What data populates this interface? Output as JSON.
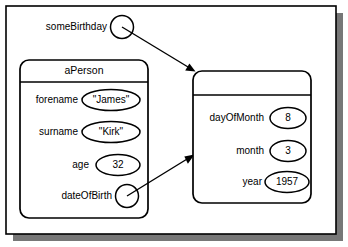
{
  "diagram": {
    "kind": "uml-object-diagram",
    "background_color": "#ffffff",
    "line_color": "#000000",
    "shadow_color": "#777777"
  },
  "free_reference": {
    "label": "someBirthday",
    "handle_icon": "reference-circle-icon"
  },
  "person_object": {
    "name": "aPerson",
    "attributes": [
      {
        "name": "forename",
        "value": "\"James\"",
        "value_shape": "ellipse"
      },
      {
        "name": "surname",
        "value": "\"Kirk\"",
        "value_shape": "ellipse"
      },
      {
        "name": "age",
        "value": "32",
        "value_shape": "ellipse"
      },
      {
        "name": "dateOfBirth",
        "value": "",
        "value_shape": "reference-circle"
      }
    ]
  },
  "date_object": {
    "name": "",
    "attributes": [
      {
        "name": "dayOfMonth",
        "value": "8",
        "value_shape": "ellipse"
      },
      {
        "name": "month",
        "value": "3",
        "value_shape": "ellipse"
      },
      {
        "name": "year",
        "value": "1957",
        "value_shape": "ellipse"
      }
    ]
  },
  "links": [
    {
      "from": "someBirthday",
      "to": "date-object",
      "style": "open-arrow"
    },
    {
      "from": "dateOfBirth",
      "to": "date-object",
      "style": "open-arrow"
    }
  ]
}
